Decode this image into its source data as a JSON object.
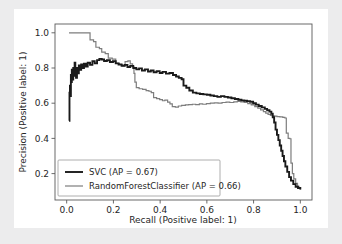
{
  "figure": {
    "background_color": "#ffffff",
    "canvas_color": "#ececed"
  },
  "chart_data": {
    "type": "line",
    "title": "",
    "xlabel": "Recall (Positive label: 1)",
    "ylabel": "Precision (Positive label: 1)",
    "xlim": [
      -0.05,
      1.05
    ],
    "ylim": [
      0.05,
      1.05
    ],
    "xticks": [
      "0.0",
      "0.2",
      "0.4",
      "0.6",
      "0.8",
      "1.0"
    ],
    "xtick_values": [
      0.0,
      0.2,
      0.4,
      0.6,
      0.8,
      1.0
    ],
    "yticks": [
      "0.2",
      "0.4",
      "0.6",
      "0.8",
      "1.0"
    ],
    "ytick_values": [
      0.2,
      0.4,
      0.6,
      0.8,
      1.0
    ],
    "grid": false,
    "legend_position": "lower left",
    "series": [
      {
        "name": "SVC (AP = 0.67)",
        "color": "#1a1a1a",
        "width": 1.9,
        "points": [
          [
            0.01,
            0.5
          ],
          [
            0.012,
            0.66
          ],
          [
            0.014,
            0.7
          ],
          [
            0.016,
            0.64
          ],
          [
            0.018,
            0.76
          ],
          [
            0.02,
            0.72
          ],
          [
            0.022,
            0.79
          ],
          [
            0.025,
            0.735
          ],
          [
            0.028,
            0.8
          ],
          [
            0.031,
            0.755
          ],
          [
            0.034,
            0.83
          ],
          [
            0.037,
            0.78
          ],
          [
            0.04,
            0.745
          ],
          [
            0.044,
            0.8
          ],
          [
            0.048,
            0.77
          ],
          [
            0.052,
            0.815
          ],
          [
            0.057,
            0.79
          ],
          [
            0.062,
            0.82
          ],
          [
            0.068,
            0.8
          ],
          [
            0.074,
            0.825
          ],
          [
            0.082,
            0.808
          ],
          [
            0.09,
            0.83
          ],
          [
            0.1,
            0.818
          ],
          [
            0.11,
            0.838
          ],
          [
            0.12,
            0.826
          ],
          [
            0.13,
            0.845
          ],
          [
            0.14,
            0.852
          ],
          [
            0.15,
            0.848
          ],
          [
            0.16,
            0.84
          ],
          [
            0.172,
            0.844
          ],
          [
            0.185,
            0.834
          ],
          [
            0.198,
            0.838
          ],
          [
            0.21,
            0.826
          ],
          [
            0.222,
            0.82
          ],
          [
            0.235,
            0.812
          ],
          [
            0.248,
            0.818
          ],
          [
            0.26,
            0.806
          ],
          [
            0.272,
            0.812
          ],
          [
            0.285,
            0.8
          ],
          [
            0.298,
            0.792
          ],
          [
            0.31,
            0.798
          ],
          [
            0.322,
            0.786
          ],
          [
            0.335,
            0.792
          ],
          [
            0.348,
            0.78
          ],
          [
            0.36,
            0.786
          ],
          [
            0.372,
            0.776
          ],
          [
            0.385,
            0.782
          ],
          [
            0.398,
            0.772
          ],
          [
            0.41,
            0.778
          ],
          [
            0.425,
            0.768
          ],
          [
            0.44,
            0.772
          ],
          [
            0.455,
            0.76
          ],
          [
            0.468,
            0.752
          ],
          [
            0.48,
            0.744
          ],
          [
            0.492,
            0.736
          ],
          [
            0.5,
            0.7
          ],
          [
            0.512,
            0.688
          ],
          [
            0.525,
            0.672
          ],
          [
            0.54,
            0.66
          ],
          [
            0.555,
            0.656
          ],
          [
            0.57,
            0.652
          ],
          [
            0.585,
            0.65
          ],
          [
            0.6,
            0.648
          ],
          [
            0.615,
            0.644
          ],
          [
            0.63,
            0.64
          ],
          [
            0.645,
            0.636
          ],
          [
            0.66,
            0.64
          ],
          [
            0.675,
            0.636
          ],
          [
            0.69,
            0.632
          ],
          [
            0.705,
            0.628
          ],
          [
            0.72,
            0.624
          ],
          [
            0.735,
            0.62
          ],
          [
            0.748,
            0.616
          ],
          [
            0.76,
            0.614
          ],
          [
            0.772,
            0.612
          ],
          [
            0.785,
            0.608
          ],
          [
            0.798,
            0.6
          ],
          [
            0.81,
            0.592
          ],
          [
            0.822,
            0.584
          ],
          [
            0.835,
            0.576
          ],
          [
            0.848,
            0.568
          ],
          [
            0.858,
            0.56
          ],
          [
            0.868,
            0.552
          ],
          [
            0.876,
            0.54
          ],
          [
            0.882,
            0.52
          ],
          [
            0.888,
            0.49
          ],
          [
            0.894,
            0.45
          ],
          [
            0.9,
            0.42
          ],
          [
            0.906,
            0.39
          ],
          [
            0.912,
            0.36
          ],
          [
            0.918,
            0.33
          ],
          [
            0.924,
            0.3
          ],
          [
            0.93,
            0.27
          ],
          [
            0.936,
            0.24
          ],
          [
            0.944,
            0.21
          ],
          [
            0.952,
            0.18
          ],
          [
            0.96,
            0.16
          ],
          [
            0.97,
            0.14
          ],
          [
            0.98,
            0.125
          ],
          [
            0.99,
            0.118
          ],
          [
            1.0,
            0.11
          ]
        ]
      },
      {
        "name": "RandomForestClassifier (AP = 0.66)",
        "color": "#7d7d7d",
        "width": 1.2,
        "points": [
          [
            0.01,
            1.0
          ],
          [
            0.06,
            1.0
          ],
          [
            0.095,
            1.0
          ],
          [
            0.1,
            0.96
          ],
          [
            0.115,
            0.95
          ],
          [
            0.125,
            0.918
          ],
          [
            0.14,
            0.91
          ],
          [
            0.15,
            0.89
          ],
          [
            0.165,
            0.882
          ],
          [
            0.178,
            0.856
          ],
          [
            0.195,
            0.85
          ],
          [
            0.21,
            0.826
          ],
          [
            0.225,
            0.82
          ],
          [
            0.24,
            0.812
          ],
          [
            0.25,
            0.836
          ],
          [
            0.262,
            0.84
          ],
          [
            0.272,
            0.824
          ],
          [
            0.282,
            0.806
          ],
          [
            0.288,
            0.77
          ],
          [
            0.292,
            0.72
          ],
          [
            0.298,
            0.688
          ],
          [
            0.31,
            0.682
          ],
          [
            0.325,
            0.678
          ],
          [
            0.34,
            0.672
          ],
          [
            0.352,
            0.668
          ],
          [
            0.362,
            0.66
          ],
          [
            0.372,
            0.632
          ],
          [
            0.385,
            0.626
          ],
          [
            0.398,
            0.62
          ],
          [
            0.41,
            0.614
          ],
          [
            0.42,
            0.618
          ],
          [
            0.432,
            0.606
          ],
          [
            0.442,
            0.596
          ],
          [
            0.452,
            0.58
          ],
          [
            0.465,
            0.578
          ],
          [
            0.478,
            0.584
          ],
          [
            0.492,
            0.588
          ],
          [
            0.508,
            0.59
          ],
          [
            0.522,
            0.592
          ],
          [
            0.538,
            0.594
          ],
          [
            0.552,
            0.592
          ],
          [
            0.568,
            0.596
          ],
          [
            0.582,
            0.594
          ],
          [
            0.598,
            0.598
          ],
          [
            0.615,
            0.6
          ],
          [
            0.632,
            0.602
          ],
          [
            0.648,
            0.6
          ],
          [
            0.665,
            0.604
          ],
          [
            0.682,
            0.606
          ],
          [
            0.698,
            0.604
          ],
          [
            0.715,
            0.608
          ],
          [
            0.73,
            0.61
          ],
          [
            0.745,
            0.608
          ],
          [
            0.76,
            0.604
          ],
          [
            0.775,
            0.598
          ],
          [
            0.79,
            0.59
          ],
          [
            0.805,
            0.58
          ],
          [
            0.818,
            0.572
          ],
          [
            0.83,
            0.562
          ],
          [
            0.842,
            0.552
          ],
          [
            0.852,
            0.544
          ],
          [
            0.862,
            0.536
          ],
          [
            0.872,
            0.53
          ],
          [
            0.88,
            0.528
          ],
          [
            0.89,
            0.526
          ],
          [
            0.9,
            0.524
          ],
          [
            0.912,
            0.522
          ],
          [
            0.925,
            0.52
          ],
          [
            0.934,
            0.516
          ],
          [
            0.94,
            0.43
          ],
          [
            0.948,
            0.4
          ],
          [
            0.955,
            0.398
          ],
          [
            0.96,
            0.26
          ],
          [
            0.966,
            0.2
          ],
          [
            0.972,
            0.17
          ],
          [
            0.98,
            0.145
          ],
          [
            0.988,
            0.128
          ],
          [
            0.994,
            0.118
          ],
          [
            1.0,
            0.11
          ]
        ]
      }
    ]
  }
}
